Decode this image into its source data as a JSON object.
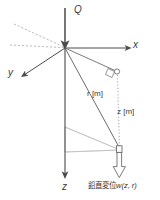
{
  "figure": {
    "background_color": "#ffffff",
    "line_color": "#4a4a4a",
    "faint_line_color": "#b9b9b9",
    "dotted_line_color": "#9a9a9a",
    "text_color": "#3a3a3a",
    "width": 160,
    "height": 200
  },
  "labels": {
    "load": "Q",
    "axis_x": "x",
    "axis_y": "y",
    "axis_z": "z",
    "radial_distance": "r [m]",
    "depth": "z [m]",
    "caption_jp": "鉛直変位",
    "caption_var": "w",
    "caption_args": "(z, r)"
  },
  "geometry": {
    "origin": {
      "x": 65,
      "y": 48
    },
    "load_arrow": {
      "x": 65,
      "y_start": 8,
      "y_end": 46
    },
    "x_axis_end": {
      "x": 130,
      "y": 48
    },
    "y_axis_end": {
      "x": 22,
      "y": 76
    },
    "z_axis_end": {
      "x": 65,
      "y": 177
    },
    "dashed_diagonal_start": {
      "x": 14,
      "y": 24
    },
    "dashed_horizontal_start": {
      "x": 10,
      "y": 45
    },
    "surface_point": {
      "x": 117,
      "y": 72
    },
    "deep_point": {
      "x": 120,
      "y": 150
    },
    "plane_left_top": {
      "x": 65,
      "y": 127
    },
    "plane_left_bottom": {
      "x": 65,
      "y": 152
    }
  },
  "icons": {
    "load_arrow": "down-arrow-solid",
    "x_axis_arrow": "right-arrow",
    "y_axis_arrow": "down-left-arrow",
    "z_axis_arrow": "down-arrow",
    "displacement_arrow": "hollow-down-arrow",
    "surface_marker": "small-circle",
    "depth_marker": "small-square",
    "right_angle_marker": "right-angle-square"
  }
}
